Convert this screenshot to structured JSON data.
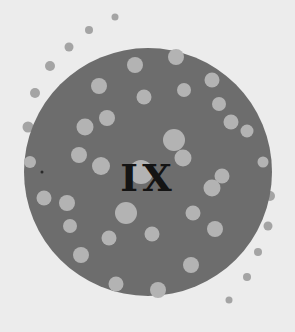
{
  "emblem": {
    "text": "IX",
    "background_color": "#ececec",
    "disc_color": "#6d6d6d",
    "dot_color": "#b3b3b3",
    "outer_dot_color": "#a4a4a4",
    "text_color": "#141414"
  }
}
